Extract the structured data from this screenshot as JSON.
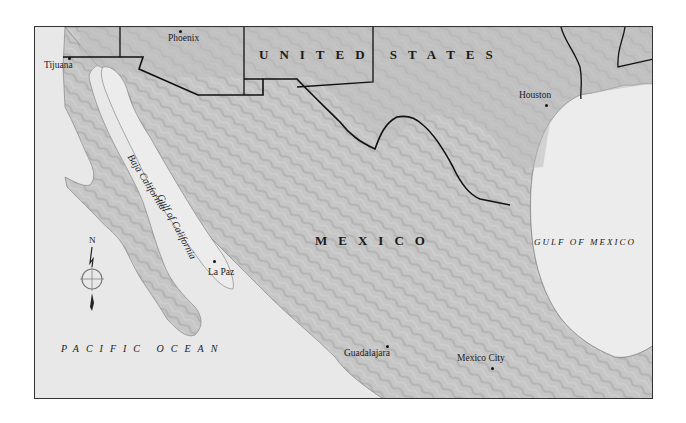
{
  "map": {
    "countries": [
      {
        "id": "us",
        "label": "UNITED    STATES"
      },
      {
        "id": "mx",
        "label": "MEXICO"
      }
    ],
    "water_bodies": {
      "gulf_of_mexico": "GULF OF MEXICO",
      "pacific_ocean": "PACIFIC  OCEAN",
      "gulf_of_california": "Gulf of California"
    },
    "regions": {
      "baja_california": "Baja California"
    },
    "cities": [
      {
        "id": "tijuana",
        "label": "Tijuana"
      },
      {
        "id": "phoenix",
        "label": "Phoenix"
      },
      {
        "id": "houston",
        "label": "Houston"
      },
      {
        "id": "la_paz",
        "label": "La Paz"
      },
      {
        "id": "guadalajara",
        "label": "Guadalajara"
      },
      {
        "id": "mexico_city",
        "label": "Mexico City"
      }
    ],
    "compass": {
      "north_label": "N"
    },
    "colors": {
      "water": "#e8e8e8",
      "land": "#c4c4c4",
      "relief": "#a9a9a9",
      "border": "#111111",
      "frame": "#333333"
    }
  }
}
